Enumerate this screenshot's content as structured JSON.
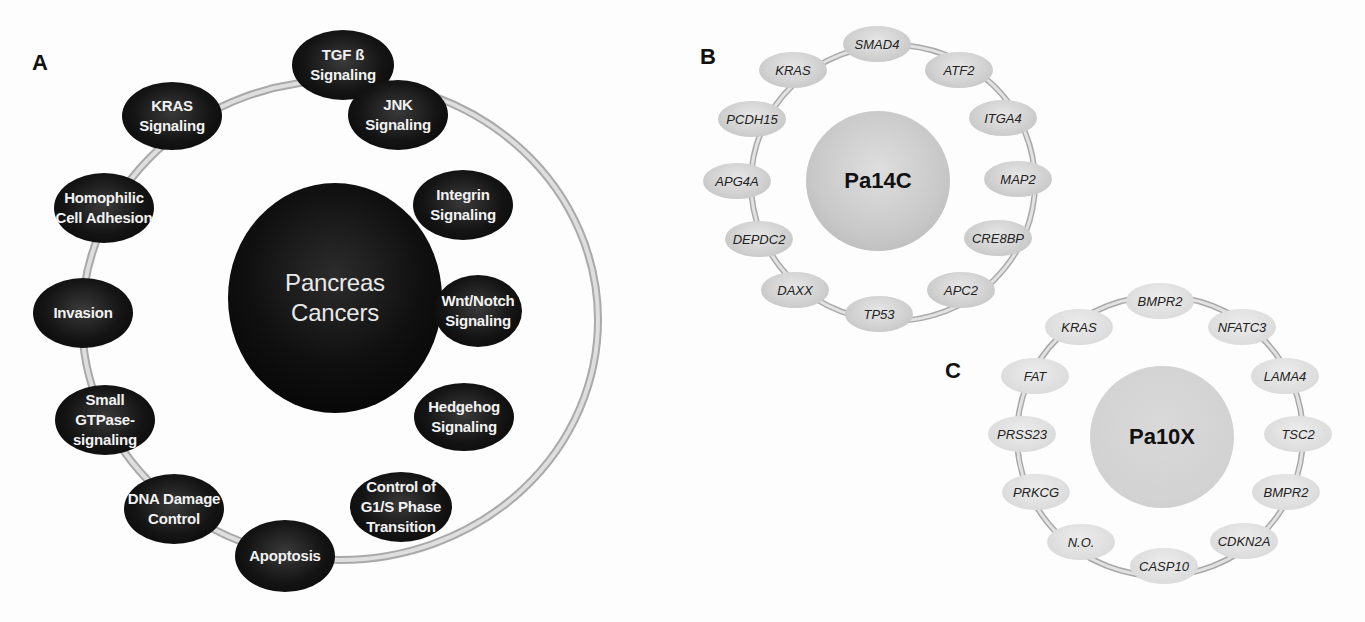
{
  "panels": {
    "A": {
      "label": "A",
      "hub": "Pancreas\nCancers",
      "nodes": [
        {
          "label": "TGF ß\nSignaling"
        },
        {
          "label": "JNK\nSignaling"
        },
        {
          "label": "Integrin\nSignaling"
        },
        {
          "label": "Wnt/Notch\nSignaling"
        },
        {
          "label": "Hedgehog\nSignaling"
        },
        {
          "label": "Control of\nG1/S Phase\nTransition"
        },
        {
          "label": "Apoptosis"
        },
        {
          "label": "DNA Damage\nControl"
        },
        {
          "label": "Small\nGTPase-\nsignaling"
        },
        {
          "label": "Invasion"
        },
        {
          "label": "Homophilic\nCell Adhesion"
        },
        {
          "label": "KRAS\nSignaling"
        }
      ]
    },
    "B": {
      "label": "B",
      "hub": "Pa14C",
      "nodes": [
        {
          "label": "SMAD4"
        },
        {
          "label": "ATF2"
        },
        {
          "label": "ITGA4"
        },
        {
          "label": "MAP2"
        },
        {
          "label": "CRE8BP"
        },
        {
          "label": "APC2"
        },
        {
          "label": "TP53"
        },
        {
          "label": "DAXX"
        },
        {
          "label": "DEPDC2"
        },
        {
          "label": "APG4A"
        },
        {
          "label": "PCDH15"
        },
        {
          "label": "KRAS"
        }
      ]
    },
    "C": {
      "label": "C",
      "hub": "Pa10X",
      "nodes": [
        {
          "label": "BMPR2"
        },
        {
          "label": "NFATC3"
        },
        {
          "label": "LAMA4"
        },
        {
          "label": "TSC2"
        },
        {
          "label": "BMPR2"
        },
        {
          "label": "CDKN2A"
        },
        {
          "label": "CASP10"
        },
        {
          "label": "N.O."
        },
        {
          "label": "PRKCG"
        },
        {
          "label": "PRSS23"
        },
        {
          "label": "FAT"
        },
        {
          "label": "KRAS"
        }
      ]
    }
  },
  "colors": {
    "link": "#c8c8c8",
    "link_edge": "#a9a9a9",
    "dark_node": "#111111",
    "light_node": "#d0d0d0"
  }
}
